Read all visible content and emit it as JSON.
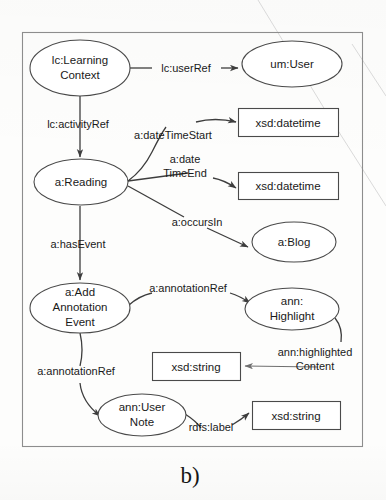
{
  "figure": {
    "caption": "b)",
    "type": "ontology-graph-diagram"
  },
  "nodes": {
    "learning_context": {
      "label_line1": "lc:Learning",
      "label_line2": "Context",
      "shape": "ellipse"
    },
    "um_user": {
      "label_line1": "um:User",
      "shape": "ellipse"
    },
    "a_reading": {
      "label_line1": "a:Reading",
      "shape": "ellipse"
    },
    "xsd_datetime_start": {
      "label_line1": "xsd:datetime",
      "shape": "rect"
    },
    "xsd_datetime_end": {
      "label_line1": "xsd:datetime",
      "shape": "rect"
    },
    "a_blog": {
      "label_line1": "a:Blog",
      "shape": "ellipse"
    },
    "add_annotation_event": {
      "label_line1": "a:Add",
      "label_line2": "Annotation",
      "label_line3": "Event",
      "shape": "ellipse"
    },
    "ann_highlight": {
      "label_line1": "ann:",
      "label_line2": "Highlight",
      "shape": "ellipse"
    },
    "xsd_string_highlight": {
      "label_line1": "xsd:string",
      "shape": "rect"
    },
    "ann_user_note": {
      "label_line1": "ann:User",
      "label_line2": "Note",
      "shape": "ellipse"
    },
    "xsd_string_label": {
      "label_line1": "xsd:string",
      "shape": "rect"
    }
  },
  "edges": {
    "user_ref": {
      "label_line1": "lc:userRef",
      "from": "learning_context",
      "to": "um_user"
    },
    "activity_ref": {
      "label_line1": "lc:activityRef",
      "from": "learning_context",
      "to": "a_reading"
    },
    "date_time_start": {
      "label_line1": "a:dateTimeStart",
      "from": "a_reading",
      "to": "xsd_datetime_start"
    },
    "date_time_end": {
      "label_line1": "a:date",
      "label_line2": "TimeEnd",
      "from": "a_reading",
      "to": "xsd_datetime_end"
    },
    "occurs_in": {
      "label_line1": "a:occursIn",
      "from": "a_reading",
      "to": "a_blog"
    },
    "has_event": {
      "label_line1": "a:hasEvent",
      "from": "a_reading",
      "to": "add_annotation_event"
    },
    "annotation_ref_highlight": {
      "label_line1": "a:annotationRef",
      "from": "add_annotation_event",
      "to": "ann_highlight"
    },
    "highlighted_content": {
      "label_line1": "ann:highlighted",
      "label_line2": "Content",
      "from": "ann_highlight",
      "to": "xsd_string_highlight"
    },
    "annotation_ref_note": {
      "label_line1": "a:annotationRef",
      "from": "add_annotation_event",
      "to": "ann_user_note"
    },
    "rdfs_label": {
      "label_line1": "rdfs:label",
      "from": "ann_user_note",
      "to": "xsd_string_label"
    }
  },
  "colors": {
    "stroke": "#4a4a4a",
    "edge": "#3d3d3d",
    "frame": "#8d8d8d",
    "text": "#1a1a1a",
    "background": "#fdfdfc"
  }
}
